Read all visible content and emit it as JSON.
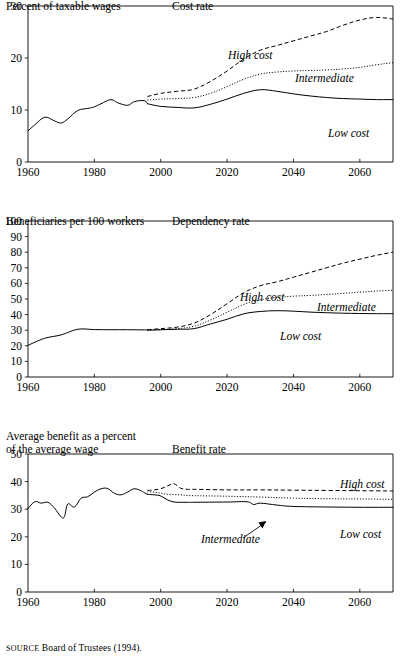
{
  "figure": {
    "source_label": "SOURCE",
    "source_text": " Board of Trustees (1994)."
  },
  "panels": [
    {
      "id": "cost",
      "y_axis_label": "Percent of taxable wages",
      "chart_title": "Cost rate",
      "labels": {
        "high": "High cost",
        "intermediate": "Intermediate",
        "low": "Low cost"
      }
    },
    {
      "id": "dependency",
      "y_axis_label": "Beneficiaries per 100 workers",
      "chart_title": "Dependency rate",
      "labels": {
        "high": "High cost",
        "intermediate": "Intermediate",
        "low": "Low cost"
      }
    },
    {
      "id": "benefit",
      "y_axis_label": "Average benefit as a percent\nof the average wage",
      "chart_title": "Benefit rate",
      "labels": {
        "high": "High cost",
        "intermediate": "Intermediate",
        "low": "Low cost"
      }
    }
  ],
  "chart_data": [
    {
      "type": "line",
      "id": "cost-rate",
      "title": "Cost rate",
      "xlabel": "",
      "ylabel": "Percent of taxable wages",
      "xlim": [
        1960,
        2070
      ],
      "ylim": [
        0,
        30
      ],
      "yticks": [
        0,
        10,
        20,
        30
      ],
      "xticks": [
        1960,
        1980,
        2000,
        2020,
        2040,
        2060
      ],
      "grid": false,
      "legend": "inline-annotations",
      "series": [
        {
          "name": "Historical",
          "style": "solid",
          "x": [
            1960,
            1962,
            1965,
            1968,
            1970,
            1972,
            1975,
            1978,
            1980,
            1982,
            1985,
            1987,
            1990,
            1992,
            1995,
            1996
          ],
          "values": [
            6.0,
            7.1,
            8.6,
            7.9,
            7.5,
            8.3,
            9.9,
            10.3,
            10.6,
            11.2,
            12.0,
            11.4,
            10.9,
            11.6,
            11.8,
            11.2
          ]
        },
        {
          "name": "High cost",
          "style": "dashed",
          "x": [
            1996,
            2000,
            2005,
            2010,
            2015,
            2020,
            2025,
            2030,
            2035,
            2040,
            2045,
            2050,
            2055,
            2060,
            2065,
            2070
          ],
          "values": [
            12.6,
            13.2,
            13.6,
            14.0,
            15.5,
            17.5,
            19.8,
            21.5,
            22.4,
            23.3,
            24.2,
            25.1,
            26.3,
            27.3,
            27.8,
            27.5
          ]
        },
        {
          "name": "Intermediate",
          "style": "dotted",
          "x": [
            1996,
            2000,
            2005,
            2010,
            2015,
            2020,
            2025,
            2030,
            2035,
            2040,
            2045,
            2050,
            2055,
            2060,
            2065,
            2070
          ],
          "values": [
            11.9,
            12.1,
            12.2,
            12.4,
            13.2,
            14.5,
            15.9,
            16.9,
            17.3,
            17.5,
            17.6,
            17.7,
            17.9,
            18.2,
            18.7,
            19.1
          ]
        },
        {
          "name": "Low cost",
          "style": "solid",
          "x": [
            1996,
            2000,
            2005,
            2010,
            2015,
            2020,
            2025,
            2030,
            2035,
            2040,
            2045,
            2050,
            2055,
            2060,
            2065,
            2070
          ],
          "values": [
            11.2,
            10.7,
            10.5,
            10.4,
            11.1,
            12.1,
            13.2,
            13.9,
            13.6,
            13.1,
            12.7,
            12.4,
            12.2,
            12.1,
            12.0,
            12.0
          ]
        }
      ]
    },
    {
      "type": "line",
      "id": "dependency-rate",
      "title": "Dependency rate",
      "xlabel": "",
      "ylabel": "Beneficiaries per 100 workers",
      "xlim": [
        1960,
        2070
      ],
      "ylim": [
        0,
        100
      ],
      "yticks": [
        0,
        10,
        20,
        30,
        40,
        50,
        60,
        70,
        80,
        90,
        100
      ],
      "xticks": [
        1960,
        1980,
        2000,
        2020,
        2040,
        2060
      ],
      "grid": false,
      "legend": "inline-annotations",
      "series": [
        {
          "name": "Historical",
          "style": "solid",
          "x": [
            1960,
            1965,
            1970,
            1975,
            1980,
            1985,
            1990,
            1995,
            1996
          ],
          "values": [
            20.3,
            24.8,
            27.0,
            30.6,
            30.4,
            30.3,
            30.3,
            30.2,
            30.1
          ]
        },
        {
          "name": "High cost",
          "style": "dashed",
          "x": [
            1996,
            2000,
            2005,
            2010,
            2015,
            2020,
            2025,
            2030,
            2035,
            2040,
            2045,
            2050,
            2055,
            2060,
            2065,
            2070
          ],
          "values": [
            30.3,
            31.0,
            32.0,
            34.5,
            40.0,
            47.0,
            54.0,
            58.5,
            61.0,
            64.0,
            67.0,
            70.0,
            73.0,
            75.5,
            78.0,
            80.0
          ]
        },
        {
          "name": "Intermediate",
          "style": "dotted",
          "x": [
            1996,
            2000,
            2005,
            2010,
            2015,
            2020,
            2025,
            2030,
            2035,
            2040,
            2045,
            2050,
            2055,
            2060,
            2065,
            2070
          ],
          "values": [
            30.1,
            30.3,
            31.0,
            32.5,
            36.5,
            41.5,
            46.5,
            49.5,
            51.0,
            51.8,
            52.3,
            52.9,
            53.6,
            54.4,
            55.1,
            55.6
          ]
        },
        {
          "name": "Low cost",
          "style": "solid",
          "x": [
            1996,
            2000,
            2005,
            2010,
            2015,
            2020,
            2025,
            2030,
            2035,
            2040,
            2045,
            2050,
            2055,
            2060,
            2065,
            2070
          ],
          "values": [
            30.0,
            30.3,
            30.6,
            31.0,
            34.0,
            37.0,
            40.5,
            42.0,
            42.5,
            42.2,
            41.6,
            41.2,
            40.9,
            40.7,
            40.6,
            40.6
          ]
        }
      ]
    },
    {
      "type": "line",
      "id": "benefit-rate",
      "title": "Benefit rate",
      "xlabel": "",
      "ylabel": "Average benefit as a percent of the average wage",
      "xlim": [
        1960,
        2070
      ],
      "ylim": [
        0,
        50
      ],
      "yticks": [
        0,
        10,
        20,
        30,
        40,
        50
      ],
      "xticks": [
        1960,
        1980,
        2000,
        2020,
        2040,
        2060
      ],
      "grid": false,
      "legend": "inline-annotations",
      "series": [
        {
          "name": "Historical",
          "style": "solid",
          "x": [
            1960,
            1962,
            1964,
            1966,
            1968,
            1970,
            1971,
            1972,
            1974,
            1976,
            1978,
            1980,
            1982,
            1984,
            1986,
            1988,
            1990,
            1992,
            1994,
            1995,
            1996
          ],
          "values": [
            30.2,
            32.7,
            32.2,
            32.5,
            30.4,
            27.2,
            27.4,
            31.9,
            30.8,
            34.0,
            34.5,
            36.2,
            37.4,
            37.5,
            35.8,
            35.2,
            36.2,
            37.4,
            36.7,
            36.0,
            35.4
          ]
        },
        {
          "name": "High cost",
          "style": "dashed",
          "x": [
            1996,
            1998,
            2000,
            2002,
            2004,
            2006,
            2008,
            2010,
            2020,
            2030,
            2040,
            2050,
            2060,
            2070
          ],
          "values": [
            36.8,
            37.0,
            37.4,
            38.4,
            39.2,
            37.6,
            37.2,
            37.2,
            37.0,
            37.0,
            36.9,
            36.8,
            36.7,
            36.6
          ]
        },
        {
          "name": "Intermediate",
          "style": "dotted",
          "x": [
            1996,
            1998,
            2000,
            2002,
            2004,
            2006,
            2008,
            2010,
            2020,
            2030,
            2040,
            2050,
            2060,
            2070
          ],
          "values": [
            36.3,
            36.2,
            35.8,
            35.4,
            35.3,
            35.2,
            35.0,
            34.9,
            34.7,
            34.4,
            34.0,
            33.8,
            33.7,
            33.6
          ]
        },
        {
          "name": "Low cost",
          "style": "solid",
          "x": [
            1996,
            1998,
            2000,
            2002,
            2004,
            2006,
            2008,
            2010,
            2020,
            2026,
            2028,
            2030,
            2035,
            2040,
            2050,
            2060,
            2070
          ],
          "values": [
            35.4,
            35.2,
            34.8,
            33.4,
            32.6,
            32.5,
            32.5,
            32.5,
            32.6,
            32.7,
            31.7,
            32.2,
            31.5,
            31.0,
            30.8,
            30.7,
            30.7
          ]
        }
      ]
    }
  ]
}
